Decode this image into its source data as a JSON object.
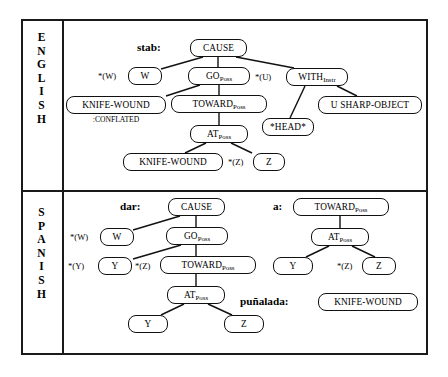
{
  "figure": {
    "background_color": "#ffffff",
    "line_color": "#111111",
    "border_color": "#1a1a1a"
  },
  "rows": {
    "english": {
      "label_letters": [
        "E",
        "N",
        "G",
        "L",
        "I",
        "S",
        "H"
      ],
      "label_text": "ENGLISH"
    },
    "spanish": {
      "label_letters": [
        "S",
        "P",
        "A",
        "N",
        "I",
        "S",
        "H"
      ],
      "label_text": "SPANISH"
    }
  },
  "english_tree": {
    "word": "stab:",
    "nodes": {
      "cause": "CAUSE",
      "w": "W",
      "go": "GO",
      "go_sub": "Poss",
      "with": "WITH",
      "with_sub": "Instr",
      "knife_wound_conflated": "KNIFE-WOUND",
      "toward": "TOWARD",
      "toward_sub": "Poss",
      "sharp_object": "U  SHARP-OBJECT",
      "head": "*HEAD*",
      "at": "AT",
      "at_sub": "Poss",
      "knife_wound": "KNIFE-WOUND",
      "z": "Z"
    },
    "annotations": {
      "conflated": ":CONFLATED"
    },
    "roles": {
      "w_role": "*(W)",
      "u_role": "*(U)",
      "z_role": "*(Z)"
    }
  },
  "spanish_tree_dar": {
    "word": "dar:",
    "nodes": {
      "cause": "CAUSE",
      "w": "W",
      "go": "GO",
      "go_sub": "Poss",
      "y_upper": "Y",
      "toward": "TOWARD",
      "toward_sub": "Poss",
      "at": "AT",
      "at_sub": "Poss",
      "y_lower": "Y",
      "z_lower": "Z"
    },
    "roles": {
      "w_role": "*(W)",
      "y_role": "*(Y)",
      "z_role": "*(Z)"
    }
  },
  "spanish_tree_a": {
    "word": "a:",
    "nodes": {
      "toward": "TOWARD",
      "toward_sub": "Poss",
      "at": "AT",
      "at_sub": "Poss",
      "y": "Y",
      "z": "Z"
    },
    "roles": {
      "z_role": "*(Z)"
    }
  },
  "spanish_tree_punalada": {
    "word": "puñalada:",
    "nodes": {
      "knife_wound": "KNIFE-WOUND"
    }
  }
}
